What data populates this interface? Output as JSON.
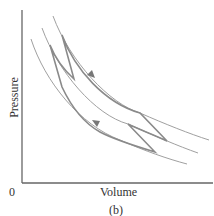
{
  "figure": {
    "panel_label": "(b)",
    "x_axis_label": "Volume",
    "y_axis_label": "Pressure",
    "origin_label": "0"
  },
  "colors": {
    "axis": "#666666",
    "curve_thin": "#9a9a9a",
    "cycle_thick": "#8a8a8a",
    "text": "#333333"
  },
  "diagram": {
    "type": "pressure-volume diagram",
    "curves": [
      {
        "name": "outer-curve",
        "start": [
          53,
          16
        ],
        "end": [
          209,
          140
        ]
      },
      {
        "name": "middle-curve",
        "start": [
          42,
          28
        ],
        "end": [
          198,
          153
        ]
      },
      {
        "name": "inner-curve",
        "start": [
          31,
          39
        ],
        "end": [
          187,
          164
        ]
      }
    ],
    "arrows": [
      {
        "name": "upper-arrow",
        "position": [
          92,
          75
        ],
        "direction": "down-right"
      },
      {
        "name": "lower-arrow",
        "position": [
          96,
          122
        ],
        "direction": "up-left"
      }
    ]
  }
}
